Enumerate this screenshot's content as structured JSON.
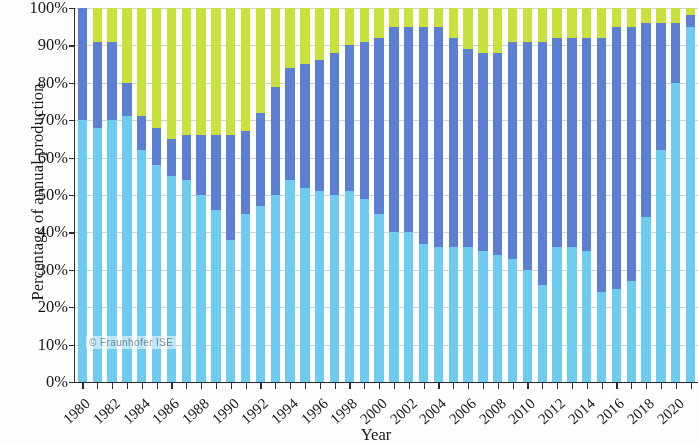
{
  "axes": {
    "ylabel": "Percentage of annual production",
    "xlabel": "Year",
    "yticks": [
      "0%",
      "10%",
      "20%",
      "30%",
      "40%",
      "50%",
      "60%",
      "70%",
      "80%",
      "90%",
      "100%"
    ],
    "ytick_values": [
      0,
      10,
      20,
      30,
      40,
      50,
      60,
      70,
      80,
      90,
      100
    ],
    "xticks": [
      "1980",
      "1982",
      "1984",
      "1986",
      "1988",
      "1990",
      "1992",
      "1994",
      "1996",
      "1998",
      "2000",
      "2002",
      "2004",
      "2006",
      "2008",
      "2010",
      "2012",
      "2014",
      "2016",
      "2018",
      "2020"
    ]
  },
  "watermark": "© Fraunhofer ISE",
  "colors": {
    "mono": "#6ecdf0",
    "multi": "#5c80d3",
    "ribbon": "#c9e23c",
    "axis": "#2b2b32",
    "grid": "#c9c9c9",
    "text": "#17171c",
    "background": "#ffffff"
  },
  "chart_data": {
    "type": "bar",
    "stacked": true,
    "title": "",
    "xlabel": "Year",
    "ylabel": "Percentage of annual production",
    "ylim": [
      0,
      100
    ],
    "xtick_step": 2,
    "grid": true,
    "legend_position": "none",
    "units": "percent",
    "categories": [
      "1980",
      "1981",
      "1982",
      "1983",
      "1984",
      "1985",
      "1986",
      "1987",
      "1988",
      "1989",
      "1990",
      "1991",
      "1992",
      "1993",
      "1994",
      "1995",
      "1996",
      "1997",
      "1998",
      "1999",
      "2000",
      "2001",
      "2002",
      "2003",
      "2004",
      "2005",
      "2006",
      "2007",
      "2008",
      "2009",
      "2010",
      "2011",
      "2012",
      "2013",
      "2014",
      "2015",
      "2016",
      "2017",
      "2018",
      "2019",
      "2020",
      "2021"
    ],
    "series": [
      {
        "name": "mono-Si",
        "color": "#6ecdf0",
        "values": [
          70,
          68,
          70,
          71,
          62,
          58,
          55,
          54,
          50,
          46,
          38,
          45,
          47,
          50,
          54,
          52,
          51,
          50,
          51,
          49,
          45,
          40,
          40,
          37,
          36,
          36,
          36,
          35,
          34,
          33,
          30,
          26,
          36,
          36,
          35,
          24,
          25,
          27,
          44,
          62,
          80,
          95
        ]
      },
      {
        "name": "multi-Si",
        "color": "#5c80d3",
        "values": [
          30,
          23,
          21,
          9,
          9,
          10,
          10,
          12,
          16,
          20,
          28,
          22,
          25,
          29,
          30,
          33,
          35,
          38,
          39,
          42,
          47,
          55,
          55,
          58,
          59,
          56,
          53,
          53,
          54,
          58,
          61,
          65,
          56,
          56,
          57,
          68,
          70,
          68,
          52,
          34,
          16,
          3
        ]
      },
      {
        "name": "ribbon / other",
        "color": "#c9e23c",
        "values": [
          0,
          9,
          9,
          20,
          29,
          32,
          35,
          34,
          34,
          34,
          34,
          33,
          28,
          21,
          16,
          15,
          14,
          12,
          10,
          9,
          8,
          5,
          5,
          5,
          5,
          8,
          11,
          12,
          12,
          9,
          9,
          9,
          8,
          8,
          8,
          8,
          5,
          5,
          4,
          4,
          4,
          2
        ]
      }
    ]
  }
}
